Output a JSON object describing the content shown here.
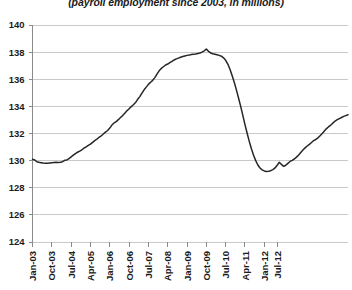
{
  "chart_title": "(payroll employment since 2003, in millions)",
  "chart_data": {
    "type": "line",
    "title": "(payroll employment since 2003, in millions)",
    "subtitle": "",
    "xlabel": "",
    "ylabel": "",
    "ylim": [
      124,
      140
    ],
    "ytick_labels": [
      "124",
      "126",
      "128",
      "130",
      "132",
      "134",
      "136",
      "138",
      "140"
    ],
    "yticks": [
      124,
      126,
      128,
      130,
      132,
      134,
      136,
      138,
      140
    ],
    "grid": true,
    "legend": false,
    "legend_position": "none",
    "xtick_labels": [
      "Jan-03",
      "Oct-03",
      "Jul-04",
      "Apr-05",
      "Jan-06",
      "Oct-06",
      "Jul-07",
      "Apr-08",
      "Jan-09",
      "Oct-09",
      "Jul-10",
      "Apr-11",
      "Jan-12",
      "Jul-12"
    ],
    "xtick_indices": [
      0,
      9,
      18,
      27,
      36,
      45,
      54,
      63,
      72,
      81,
      90,
      99,
      108,
      114
    ],
    "x_start_label": "Jan-03",
    "x_end_label": "Oct-12",
    "series": [
      {
        "name": "Payroll employment",
        "values": [
          130.1,
          130.05,
          129.92,
          129.88,
          129.85,
          129.82,
          129.8,
          129.8,
          129.82,
          129.84,
          129.86,
          129.88,
          129.86,
          129.88,
          129.92,
          130.02,
          130.05,
          130.15,
          130.28,
          130.4,
          130.52,
          130.62,
          130.7,
          130.8,
          130.92,
          131.02,
          131.12,
          131.22,
          131.35,
          131.48,
          131.58,
          131.72,
          131.82,
          131.96,
          132.1,
          132.22,
          132.4,
          132.62,
          132.78,
          132.88,
          133.02,
          133.18,
          133.32,
          133.5,
          133.68,
          133.82,
          133.98,
          134.12,
          134.28,
          134.52,
          134.72,
          134.98,
          135.22,
          135.42,
          135.62,
          135.78,
          135.92,
          136.12,
          136.38,
          136.62,
          136.8,
          136.92,
          137.05,
          137.12,
          137.22,
          137.32,
          137.42,
          137.5,
          137.56,
          137.62,
          137.68,
          137.72,
          137.76,
          137.78,
          137.82,
          137.84,
          137.86,
          137.9,
          137.94,
          138.0,
          138.1,
          138.22,
          138.06,
          137.94,
          137.88,
          137.84,
          137.8,
          137.76,
          137.7,
          137.58,
          137.4,
          137.12,
          136.74,
          136.28,
          135.78,
          135.22,
          134.62,
          134.0,
          133.34,
          132.66,
          132.02,
          131.42,
          130.88,
          130.4,
          130.0,
          129.68,
          129.46,
          129.32,
          129.24,
          129.2,
          129.22,
          129.26,
          129.34,
          129.46,
          129.66,
          129.88,
          129.72,
          129.58,
          129.66,
          129.8,
          129.94,
          130.02,
          130.12,
          130.26,
          130.42,
          130.6,
          130.78,
          130.94,
          131.08,
          131.2,
          131.34,
          131.48,
          131.56,
          131.68,
          131.84,
          132.0,
          132.18,
          132.36,
          132.5,
          132.62,
          132.78,
          132.92,
          133.02,
          133.1,
          133.18,
          133.26,
          133.32,
          133.38
        ]
      }
    ]
  }
}
